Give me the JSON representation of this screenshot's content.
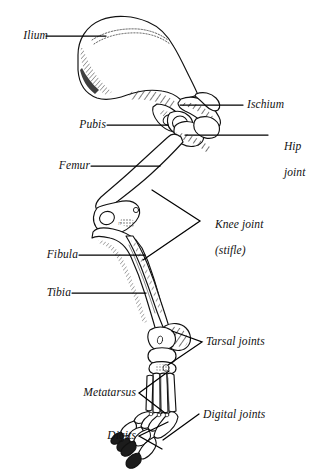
{
  "figure": {
    "background_color": "#ffffff",
    "ink_color": "#111111",
    "line_color": "#000000"
  },
  "labels": [
    {
      "id": "ilium",
      "text": "Ilium",
      "side": "left",
      "x": 10,
      "y": 30,
      "lines": [
        "Ilium"
      ]
    },
    {
      "id": "pubis",
      "text": "Pubis",
      "side": "left",
      "x": 70,
      "y": 120,
      "lines": [
        "Pubis"
      ]
    },
    {
      "id": "femur",
      "text": "Femur",
      "side": "left",
      "x": 52,
      "y": 161,
      "lines": [
        "Femur"
      ]
    },
    {
      "id": "fibula",
      "text": "Fibula",
      "side": "left",
      "x": 42,
      "y": 250,
      "lines": [
        "Fibula"
      ]
    },
    {
      "id": "tibia",
      "text": "Tibia",
      "side": "left",
      "x": 42,
      "y": 288,
      "lines": [
        "Tibia"
      ]
    },
    {
      "id": "metatarsus",
      "text": "Metatarsus",
      "side": "left",
      "x": 78,
      "y": 390,
      "lines": [
        "Metatarsus"
      ]
    },
    {
      "id": "digits",
      "text": "Digits",
      "side": "left",
      "x": 80,
      "y": 431,
      "lines": [
        "Digits"
      ]
    },
    {
      "id": "ischium",
      "text": "Ischium",
      "side": "right",
      "x": 247,
      "y": 100,
      "lines": [
        "Ischium"
      ]
    },
    {
      "id": "hip-joint",
      "text": "Hip joint",
      "side": "right",
      "x": 272,
      "y": 134,
      "lines": [
        "Hip",
        "joint"
      ]
    },
    {
      "id": "knee-joint",
      "text": "Knee joint (stifle)",
      "side": "right",
      "x": 203,
      "y": 211,
      "lines": [
        "Knee joint",
        "(stifle)"
      ]
    },
    {
      "id": "tarsal-joints",
      "text": "Tarsal joints",
      "side": "right",
      "x": 206,
      "y": 337,
      "lines": [
        "Tarsal joints"
      ]
    },
    {
      "id": "digital-joints",
      "text": "Digital joints",
      "side": "right",
      "x": 203,
      "y": 410,
      "lines": [
        "Digital joints"
      ]
    }
  ],
  "leaders": [
    {
      "id": "leader-ilium",
      "type": "line",
      "points": "46,36 106,36"
    },
    {
      "id": "leader-pubis",
      "type": "line",
      "points": "107,125 168,125"
    },
    {
      "id": "leader-femur",
      "type": "line",
      "points": "91,166 160,166"
    },
    {
      "id": "leader-fibula",
      "type": "line",
      "points": "79,255 145,255"
    },
    {
      "id": "leader-tibia",
      "type": "line",
      "points": "72,293 146,293"
    },
    {
      "id": "leader-ischium",
      "type": "line",
      "points": "180,105 243,105"
    },
    {
      "id": "leader-hip-joint",
      "type": "line",
      "points": "185,135 268,135"
    },
    {
      "id": "leader-knee-joint",
      "type": "bracket",
      "points": "152,190 200,221 143,260"
    },
    {
      "id": "leader-tarsal-joints",
      "type": "bracket",
      "points": "172,331 202,342 168,365"
    },
    {
      "id": "leader-metatarsus",
      "type": "bracket",
      "points": "169,371 139,393 165,413"
    },
    {
      "id": "leader-digits",
      "type": "bracket",
      "points": "168,422 139,436 162,449"
    },
    {
      "id": "leader-digital-joints",
      "type": "line",
      "points": "163,440 199,414"
    }
  ],
  "anatomy_parts": [
    {
      "id": "ilium",
      "name": "Ilium",
      "region": "pelvis"
    },
    {
      "id": "ischium",
      "name": "Ischium",
      "region": "pelvis"
    },
    {
      "id": "pubis",
      "name": "Pubis",
      "region": "pelvis"
    },
    {
      "id": "femur",
      "name": "Femur",
      "region": "thigh"
    },
    {
      "id": "patella",
      "name": "Patella",
      "region": "knee"
    },
    {
      "id": "tibia",
      "name": "Tibia",
      "region": "crus"
    },
    {
      "id": "fibula",
      "name": "Fibula",
      "region": "crus"
    },
    {
      "id": "tarsus",
      "name": "Tarsus",
      "region": "hock"
    },
    {
      "id": "metatarsus",
      "name": "Metatarsus",
      "region": "foot"
    },
    {
      "id": "digits",
      "name": "Digits",
      "region": "foot"
    }
  ]
}
